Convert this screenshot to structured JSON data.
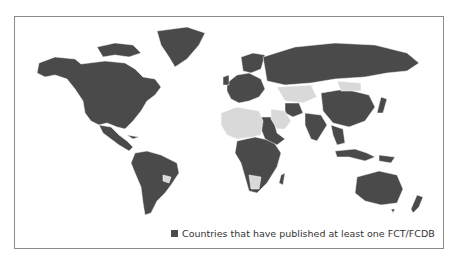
{
  "map": {
    "type": "choropleth",
    "projection": "world",
    "colors": {
      "published": "#4a4a4a",
      "not_published": "#d9d9d9",
      "border": "#ffffff",
      "frame": "#8a8a8a"
    },
    "regions": {
      "published": [
        "North America",
        "Greenland",
        "Central America",
        "South America",
        "Western Europe",
        "Russia",
        "China",
        "India",
        "Southeast Asia",
        "Japan",
        "Australia",
        "New Zealand",
        "Iran",
        "Sub-Saharan Africa (most)",
        "Sudan",
        "Ethiopia",
        "Indonesia",
        "Papua New Guinea"
      ],
      "not_published": [
        "Paraguay",
        "Sahara / North-West Africa",
        "Middle East (Arabian Peninsula)",
        "Central Asia",
        "Mongolia",
        "Scandinavia (part)",
        "Southern Africa (part)"
      ]
    }
  },
  "legend": {
    "label": "Countries that have published at least one FCT/FCDB",
    "swatch_color": "#4a4a4a"
  }
}
